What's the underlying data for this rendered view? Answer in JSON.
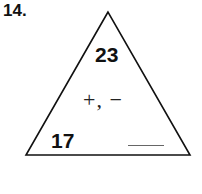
{
  "problem": {
    "number": "14.",
    "triangle": {
      "top_value": "23",
      "operations": "+, −",
      "bottom_left_value": "17",
      "bottom_right_value": ""
    }
  }
}
